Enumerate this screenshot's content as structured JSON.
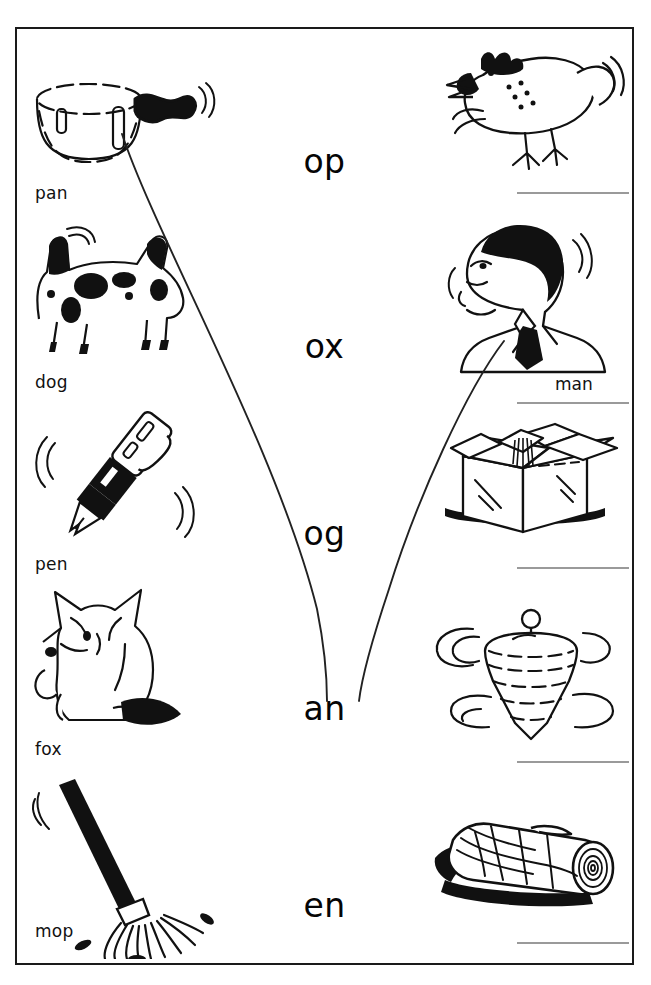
{
  "worksheet": {
    "title": "Word family matching worksheet",
    "frame_color": "#1a1a1a",
    "ink_color": "#111111",
    "answer_line_color": "#9a9a9a"
  },
  "left_column": {
    "name": "labelled-picture-column",
    "items": [
      {
        "word": "pan",
        "picture": "saucepan-illustration",
        "icon": "saucepan-icon"
      },
      {
        "word": "dog",
        "picture": "spotted-dog-illustration",
        "icon": "dog-icon"
      },
      {
        "word": "pen",
        "picture": "fountain-pen-illustration",
        "icon": "pen-icon"
      },
      {
        "word": "fox",
        "picture": "sitting-fox-illustration",
        "icon": "fox-icon"
      },
      {
        "word": "mop",
        "picture": "mop-illustration",
        "icon": "mop-icon"
      }
    ]
  },
  "center_column": {
    "name": "word-ending-column",
    "endings": [
      {
        "text": "op"
      },
      {
        "text": "ox"
      },
      {
        "text": "og"
      },
      {
        "text": "an"
      },
      {
        "text": "en"
      }
    ]
  },
  "right_column": {
    "name": "unlabelled-picture-column",
    "items": [
      {
        "word": "",
        "picture": "hen-illustration",
        "icon": "hen-icon",
        "answer_line": true
      },
      {
        "word": "man",
        "picture": "man-illustration",
        "icon": "man-icon",
        "answer_line": true
      },
      {
        "word": "",
        "picture": "open-box-illustration",
        "icon": "box-icon",
        "answer_line": true
      },
      {
        "word": "",
        "picture": "spinning-top-illustration",
        "icon": "top-icon",
        "answer_line": true
      },
      {
        "word": "",
        "picture": "log-illustration",
        "icon": "log-icon",
        "answer_line": true
      }
    ]
  },
  "connections": [
    {
      "from": "pan",
      "to": "an",
      "name": "connector-pan-to-an"
    },
    {
      "from": "man",
      "to": "an",
      "name": "connector-man-to-an"
    }
  ]
}
